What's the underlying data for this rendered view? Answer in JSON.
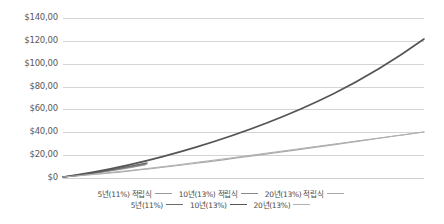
{
  "chart_data": {
    "type": "line",
    "title": "",
    "xlabel": "",
    "ylabel": "",
    "ylim": [
      0,
      140
    ],
    "grid": true,
    "legend_position": "bottom",
    "ytick_labels": [
      "$140,00",
      "$120,00",
      "$100,00",
      "$80,00",
      "$60,00",
      "$40,00",
      "$20,00",
      "$0"
    ],
    "ytick_values": [
      140,
      120,
      100,
      80,
      60,
      40,
      20,
      0
    ],
    "x": [
      0,
      1,
      2,
      3,
      4,
      5,
      6,
      7,
      8,
      9,
      10,
      11,
      12,
      13,
      14,
      15,
      16,
      17,
      18,
      19,
      20
    ],
    "series": [
      {
        "name": "5년(11%) 적립식",
        "color": "#9a9a9a",
        "width": 1.1,
        "values": [
          0,
          1.2,
          2.6,
          4.1,
          5.7,
          7.4,
          null,
          null,
          null,
          null,
          null,
          null,
          null,
          null,
          null,
          null,
          null,
          null,
          null,
          null,
          null
        ]
      },
      {
        "name": "10년(13%) 적립식",
        "color": "#8a8a8a",
        "width": 1.1,
        "values": [
          0,
          1.4,
          3.0,
          4.8,
          6.8,
          9.0,
          11.4,
          14.1,
          17.0,
          20.2,
          23.7,
          null,
          null,
          null,
          null,
          null,
          null,
          null,
          null,
          null,
          null
        ]
      },
      {
        "name": "20년(13%) 적립식",
        "color": "#a9a9a9",
        "width": 1.1,
        "values": [
          0,
          1.3,
          2.8,
          4.4,
          6.2,
          8.2,
          10.4,
          12.8,
          15.5,
          18.5,
          21.8,
          25.5,
          29.6,
          34.2,
          39.3,
          45.0,
          51.4,
          58.6,
          66.6,
          75.6,
          85.7
        ]
      },
      {
        "name": "5년(11%)",
        "color": "#6b6b6b",
        "width": 1.4,
        "values": [
          0,
          1.6,
          3.4,
          5.3,
          7.4,
          9.7,
          null,
          null,
          null,
          null,
          null,
          null,
          null,
          null,
          null,
          null,
          null,
          null,
          null,
          null,
          null
        ]
      },
      {
        "name": "10년(13%)",
        "color": "#555555",
        "width": 1.4,
        "values": [
          0,
          2.0,
          4.3,
          6.9,
          9.9,
          13.2,
          17.0,
          21.3,
          26.1,
          31.6,
          37.8,
          44.8,
          52.7,
          61.7,
          71.8,
          83.2,
          96.1,
          110.6,
          122.0,
          null,
          null
        ]
      },
      {
        "name": "20년(13%)",
        "color": "#b0b0b0",
        "width": 1.1,
        "values": [
          0,
          0.9,
          1.9,
          3.0,
          4.2,
          5.5,
          6.9,
          8.4,
          10.0,
          11.7,
          13.5,
          15.4,
          17.5,
          19.7,
          22.1,
          24.6,
          27.3,
          30.2,
          33.3,
          36.5,
          40.0
        ]
      }
    ],
    "curves_pixel": [
      {
        "name": "5년(11%) 적립식",
        "color": "#9a9a9a",
        "width": 1.1,
        "path": "M 0,159 C 24,157 50,153 82,147"
      },
      {
        "name": "10년(13%) 적립식",
        "color": "#8a8a8a",
        "width": 1.1,
        "path": "M 0,159 C 24,157 52,152 84,146"
      },
      {
        "name": "20년(13%) 적립식",
        "color": "#a9a9a9",
        "width": 1.1,
        "path": "M 0,159 C 90,153 210,135 361,114"
      },
      {
        "name": "5년(11%)",
        "color": "#6b6b6b",
        "width": 1.4,
        "path": "M 0,159 C 26,156 54,151 84,145"
      },
      {
        "name": "10년(13%)",
        "color": "#555555",
        "width": 1.6,
        "path": "M 0,159 C 80,148 185,118 270,76 C 310,56 340,36 361,21"
      },
      {
        "name": "20년(13%)",
        "color": "#b0b0b0",
        "width": 1.1,
        "path": "M 0,159 C 90,152 210,134 361,114"
      }
    ]
  },
  "legend": {
    "row1": [
      {
        "label": "5년(11%) 적립식",
        "swatch": "sw-s1"
      },
      {
        "label": "10년(13%) 적립식",
        "swatch": "sw-s2"
      },
      {
        "label": "20년(13%) 적립식",
        "swatch": "sw-s3"
      }
    ],
    "row2": [
      {
        "label": "5년(11%)",
        "swatch": "sw-s4"
      },
      {
        "label": "10년(13%)",
        "swatch": "sw-s5"
      },
      {
        "label": "20년(13%)",
        "swatch": "sw-s6"
      }
    ]
  },
  "colors": {
    "gridline": "#d4d4d4",
    "tick_text": "#595959",
    "legend_text": "#4a4a4a",
    "background": "#ffffff"
  }
}
